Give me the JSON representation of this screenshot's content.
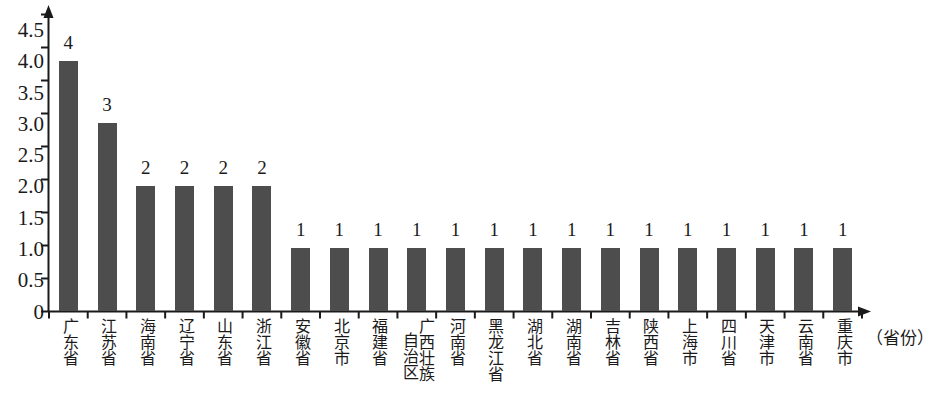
{
  "chart_data": {
    "type": "bar",
    "title": "",
    "subtitle": "",
    "xlabel": "（省份）",
    "ylabel": "",
    "ylim": [
      0,
      4.75
    ],
    "grid": false,
    "legend": null,
    "y_ticks": [
      "0",
      "0.5",
      "1.0",
      "1.5",
      "2.0",
      "2.5",
      "3.0",
      "3.5",
      "4.0",
      "4.5"
    ],
    "y_tick_values": [
      0,
      0.5,
      1.0,
      1.5,
      2.0,
      2.5,
      3.0,
      3.5,
      4.0,
      4.5
    ],
    "categories": [
      "广东省",
      "江苏省",
      "海南省",
      "辽宁省",
      "山东省",
      "浙江省",
      "安徽省",
      "北京市",
      "福建省",
      "广西壮族自治区",
      "河南省",
      "黑龙江省",
      "湖北省",
      "湖南省",
      "吉林省",
      "陕西省",
      "上海市",
      "四川省",
      "天津市",
      "云南省",
      "重庆市"
    ],
    "values": [
      4,
      3,
      2,
      2,
      2,
      2,
      1,
      1,
      1,
      1,
      1,
      1,
      1,
      1,
      1,
      1,
      1,
      1,
      1,
      1,
      1
    ],
    "data_labels": [
      "4",
      "3",
      "2",
      "2",
      "2",
      "2",
      "1",
      "1",
      "1",
      "1",
      "1",
      "1",
      "1",
      "1",
      "1",
      "1",
      "1",
      "1",
      "1",
      "1",
      "1"
    ],
    "bar_color": "#4d4d4d",
    "axis_color": "#1a1a1a"
  }
}
